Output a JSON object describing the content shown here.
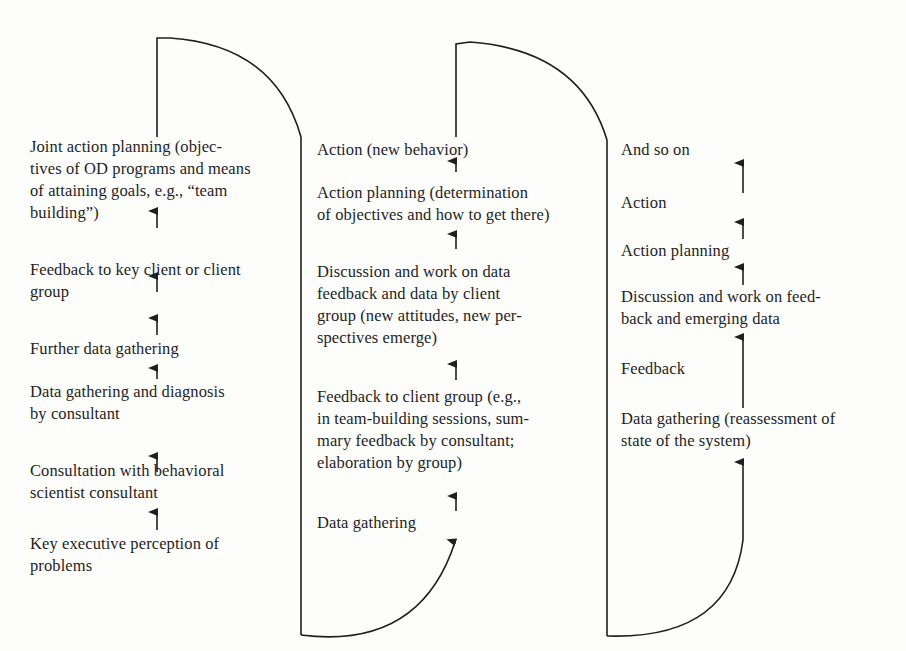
{
  "diagram": {
    "title": "",
    "stroke_color": "#1f1f1f",
    "background": "#fdfdfb",
    "columns": [
      {
        "id": "cycle-1",
        "steps_top_to_bottom": [
          {
            "text": "Joint action planning (objec-\ntives of OD programs and means\nof attaining goals, e.g., “team\nbuilding”)"
          },
          {
            "text": "Feedback to key client or client\ngroup"
          },
          {
            "text": "Further data gathering"
          },
          {
            "text": "Data gathering and diagnosis\nby consultant"
          },
          {
            "text": "Consultation with behavioral\nscientist consultant"
          },
          {
            "text": "Key executive perception of\nproblems"
          }
        ]
      },
      {
        "id": "cycle-2",
        "steps_top_to_bottom": [
          {
            "text": "Action (new behavior)"
          },
          {
            "text": "Action planning (determination\nof objectives and how to get there)"
          },
          {
            "text": "Discussion and work on data\nfeedback and data by client\ngroup (new attitudes, new per-\nspectives emerge)"
          },
          {
            "text": "Feedback to client group (e.g.,\nin team-building sessions, sum-\nmary feedback by consultant;\nelaboration by group)"
          },
          {
            "text": "Data gathering"
          }
        ]
      },
      {
        "id": "cycle-3",
        "steps_top_to_bottom": [
          {
            "text": "And so on"
          },
          {
            "text": "Action"
          },
          {
            "text": "Action planning"
          },
          {
            "text": "Discussion and work on feed-\nback and emerging data"
          },
          {
            "text": "Feedback"
          },
          {
            "text": "Data gathering (reassessment of\nstate of the system)"
          }
        ]
      }
    ]
  }
}
